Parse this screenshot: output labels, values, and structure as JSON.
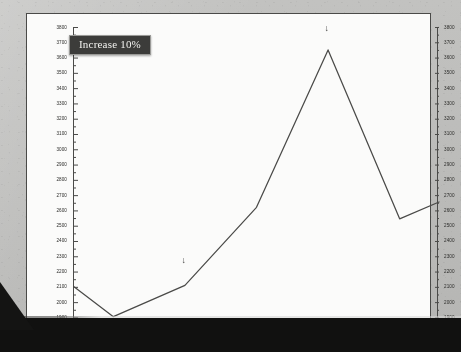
{
  "annotation": {
    "callout_text": "Increase 10%",
    "arrow_glyph": "↓",
    "arrows": [
      {
        "name": "arrow-1997",
        "x": 1997,
        "y": 2270
      },
      {
        "name": "arrow-1999",
        "x": 1999,
        "y": 3790
      }
    ]
  },
  "colors": {
    "paper": "#bdbdbb",
    "plot_background": "#fbfbfa",
    "line": "#4a4a48",
    "axis": "#4a4a48",
    "callout_background": "#3c3c3a",
    "callout_border": "#9a9a97",
    "callout_text": "#f2f2ef",
    "scan_band": "#111110"
  },
  "chart_data": {
    "type": "line",
    "title": "",
    "xlabel": "",
    "ylabel": "",
    "xlim": [
      1995.45,
      2000.55
    ],
    "ylim": [
      1870,
      3800
    ],
    "grid": false,
    "legend": "none",
    "y_axis_left": true,
    "y_axis_right": true,
    "ytick_step": 100,
    "yticks": [
      1900,
      2000,
      2100,
      2200,
      2300,
      2400,
      2500,
      2600,
      2700,
      2800,
      2900,
      3000,
      3100,
      3200,
      3300,
      3400,
      3500,
      3600,
      3700,
      3800
    ],
    "ytick_labels": [
      "1900",
      "2000",
      "2100",
      "2200",
      "2300",
      "2400",
      "2500",
      "2600",
      "2700",
      "2800",
      "2900",
      "3000",
      "3100",
      "3200",
      "3300",
      "3400",
      "3500",
      "3600",
      "3700",
      "3800"
    ],
    "categories": [
      "1996",
      "1997",
      "1998",
      "1999",
      "2000"
    ],
    "xticks": [
      1996,
      1997,
      1998,
      1999,
      2000
    ],
    "xtick_labels": [
      "1996",
      "1997",
      "1998",
      "1999",
      "2000"
    ],
    "series": [
      {
        "name": "value",
        "x": [
          1995.45,
          1996.0,
          1997.0,
          1998.0,
          1999.0,
          2000.0,
          2000.55
        ],
        "values": [
          2100,
          1905,
          2110,
          2620,
          3650,
          2545,
          2655
        ]
      }
    ]
  }
}
